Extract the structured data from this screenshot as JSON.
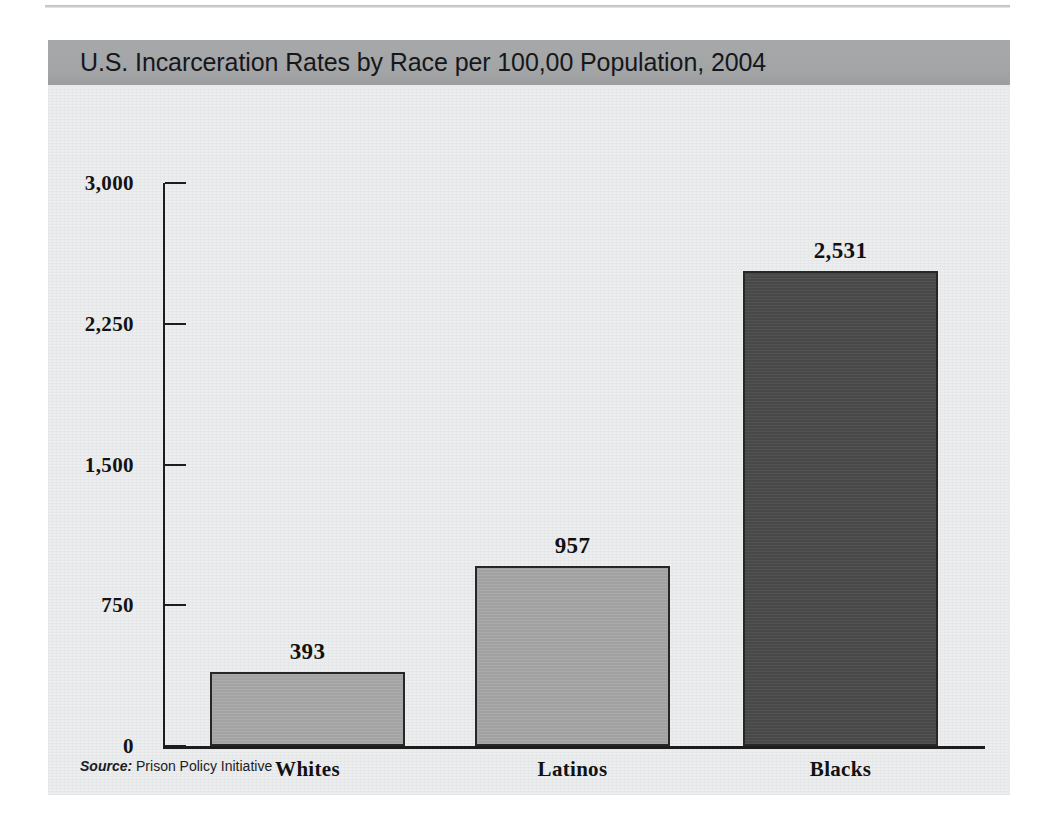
{
  "figure": {
    "title": "U.S. Incarceration Rates by Race per 100,00 Population, 2004",
    "source_label": "Source:",
    "source_name": "Prison Policy Initiative",
    "title_band_color": "#a3a4a6",
    "panel_color": "#ecedee"
  },
  "chart_data": {
    "type": "bar",
    "title": "U.S. Incarceration Rates by Race per 100,00 Population, 2004",
    "xlabel": "",
    "ylabel": "",
    "categories": [
      "Whites",
      "Latinos",
      "Blacks"
    ],
    "values": [
      393,
      957,
      2531
    ],
    "value_labels": [
      "393",
      "957",
      "2,531"
    ],
    "bar_colors": [
      "#a8a8a8",
      "#a6a6a6",
      "#4a4a4a"
    ],
    "bar_border_color": "#272727",
    "ylim": [
      0,
      3000
    ],
    "yticks": [
      0,
      750,
      1500,
      2250,
      3000
    ],
    "ytick_labels": [
      "0",
      "750",
      "1,500",
      "2,250",
      "3,000"
    ],
    "grid": false,
    "legend": null,
    "source": "Prison Policy Initiative"
  }
}
